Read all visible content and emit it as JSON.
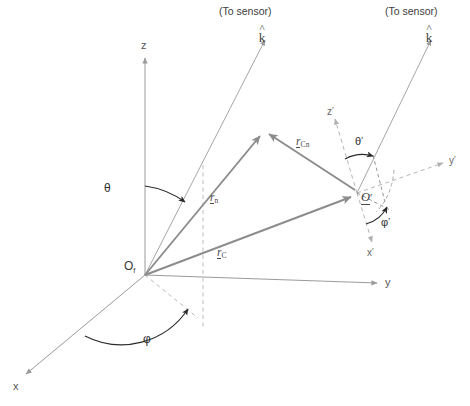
{
  "figure": {
    "type": "vector-geometry-diagram",
    "background_color": "#ffffff",
    "line_color_axis": "#9a9a9a",
    "line_color_vector": "#8c8c8c",
    "line_color_dashed": "#b4b4b4",
    "line_color_arc": "#2b2b2b",
    "text_color": "#3a3a3a"
  },
  "labels": {
    "sensor_left": "(To sensor)",
    "sensor_right": "(To sensor)",
    "khat_left_hat": "^",
    "khat_left": "k",
    "khat_right_hat": "^",
    "khat_right": "k",
    "axis_z": "z",
    "axis_y": "y",
    "axis_x": "x",
    "axis_z_prime": "z",
    "axis_y_prime": "y",
    "axis_x_prime": "x",
    "prime_mark": "′",
    "angle_theta": "θ",
    "angle_phi": "φ",
    "angle_theta_prime": "θ",
    "angle_phi_prime": "φ",
    "origin_global_base": "O",
    "origin_global_sub": "f",
    "origin_local_base": "O",
    "vector_rn_base": "r",
    "vector_rn_sub": "n",
    "vector_rc_base": "r",
    "vector_rc_sub": "C",
    "vector_rcn_base": "r",
    "vector_rcn_sub": "Cn"
  },
  "geometry": {
    "origin_global": {
      "x": 145,
      "y": 275
    },
    "origin_local": {
      "x": 357,
      "y": 193
    },
    "scatter_point": {
      "x": 263,
      "y": 131
    },
    "axis_z_tip": {
      "x": 145,
      "y": 52
    },
    "axis_y_tip": {
      "x": 383,
      "y": 283
    },
    "axis_x_tip": {
      "x": 22,
      "y": 378
    },
    "khat_left_tip": {
      "x": 262,
      "y": 34
    },
    "khat_right_tip": {
      "x": 428,
      "y": 34
    },
    "axis_zp_tip": {
      "x": 332,
      "y": 114
    },
    "axis_yp_tip": {
      "x": 449,
      "y": 160
    },
    "axis_xp_tip": {
      "x": 374,
      "y": 247
    }
  }
}
